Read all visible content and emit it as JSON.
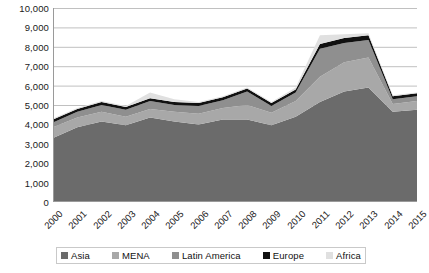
{
  "chart_data": {
    "type": "area",
    "stacked": true,
    "title": "",
    "subtitle": "",
    "xlabel": "",
    "ylabel": "",
    "grid": true,
    "legend_position": "bottom",
    "ylim": [
      0,
      10000
    ],
    "ytick_step": 1000,
    "ytick_labels": [
      "10,000",
      "9,000",
      "8,000",
      "7,000",
      "6,000",
      "5,000",
      "4,000",
      "3,000",
      "2,000",
      "1,000",
      "0"
    ],
    "ytick_values": [
      10000,
      9000,
      8000,
      7000,
      6000,
      5000,
      4000,
      3000,
      2000,
      1000,
      0
    ],
    "categories": [
      "2000",
      "2001",
      "2002",
      "2003",
      "2004",
      "2005",
      "2006",
      "2007",
      "2008",
      "2009",
      "2010",
      "2011",
      "2012",
      "2013",
      "2014",
      "2015"
    ],
    "x": [
      2000,
      2001,
      2002,
      2003,
      2004,
      2005,
      2006,
      2007,
      2008,
      2009,
      2010,
      2011,
      2012,
      2013,
      2014,
      2015
    ],
    "series": [
      {
        "name": "Asia",
        "color": "#6b6b6b",
        "values": [
          3300,
          3850,
          4150,
          3950,
          4350,
          4150,
          4000,
          4250,
          4250,
          3950,
          4400,
          5150,
          5700,
          5900,
          4650,
          4750
        ]
      },
      {
        "name": "MENA",
        "color": "#a8a8a8",
        "values": [
          550,
          500,
          500,
          450,
          450,
          500,
          550,
          600,
          750,
          650,
          800,
          1300,
          1500,
          1550,
          400,
          450
        ]
      },
      {
        "name": "Latin America",
        "color": "#8f8f8f",
        "values": [
          250,
          300,
          350,
          350,
          400,
          350,
          400,
          400,
          700,
          350,
          450,
          1450,
          1000,
          900,
          250,
          250
        ]
      },
      {
        "name": "Europe",
        "color": "#111111",
        "values": [
          150,
          150,
          150,
          150,
          150,
          150,
          150,
          150,
          150,
          150,
          150,
          250,
          250,
          250,
          150,
          150
        ]
      },
      {
        "name": "Africa",
        "color": "#e0e0e0",
        "values": [
          50,
          50,
          50,
          50,
          300,
          150,
          50,
          50,
          50,
          50,
          100,
          450,
          200,
          100,
          50,
          50
        ]
      }
    ],
    "totals": [
      4300,
      4850,
      5200,
      4950,
      5650,
      5300,
      5150,
      5450,
      5900,
      5150,
      5900,
      8600,
      8650,
      8700,
      5500,
      5650
    ]
  },
  "legend": {
    "items": [
      {
        "label": "Asia",
        "color": "#6b6b6b"
      },
      {
        "label": "MENA",
        "color": "#a8a8a8"
      },
      {
        "label": "Latin America",
        "color": "#8f8f8f"
      },
      {
        "label": "Europe",
        "color": "#111111"
      },
      {
        "label": "Africa",
        "color": "#e0e0e0"
      }
    ]
  },
  "axes": {
    "gridline_color": "#c0c0c0",
    "axis_color": "#9a9a9a"
  }
}
